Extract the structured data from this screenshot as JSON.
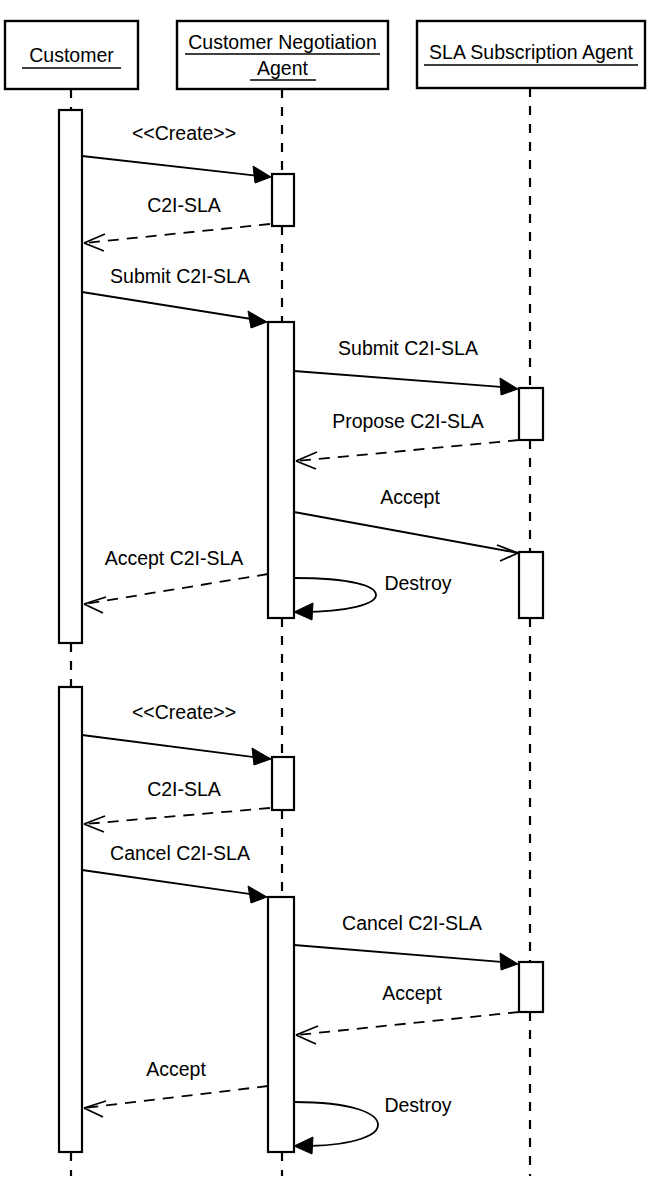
{
  "diagram": {
    "type": "uml-sequence-diagram",
    "title": "",
    "background_color": "#ffffff",
    "line_color": "#000000",
    "width": 656,
    "height": 1182
  },
  "participants": [
    {
      "id": "customer",
      "label": "Customer",
      "label_lines": [
        "Customer"
      ],
      "box": {
        "x": 5,
        "y": 21,
        "w": 133,
        "h": 68
      },
      "lifeline_x": 71
    },
    {
      "id": "customer-negotiation-agent",
      "label": "Customer Negotiation Agent",
      "label_lines": [
        "Customer Negotiation",
        "Agent"
      ],
      "box": {
        "x": 177,
        "y": 21,
        "w": 211,
        "h": 68
      },
      "lifeline_x": 282
    },
    {
      "id": "sla-subscription-agent",
      "label": "SLA Subscription Agent",
      "label_lines": [
        "SLA Subscription Agent"
      ],
      "box": {
        "x": 417,
        "y": 21,
        "w": 228,
        "h": 67
      },
      "lifeline_x": 530
    }
  ],
  "activations": [
    {
      "id": "act-customer-1",
      "participant": "customer",
      "x": 59,
      "y": 110,
      "w": 23,
      "h": 533
    },
    {
      "id": "act-agent-1a",
      "participant": "customer-negotiation-agent",
      "x": 272,
      "y": 174,
      "w": 22,
      "h": 52
    },
    {
      "id": "act-agent-1b",
      "participant": "customer-negotiation-agent",
      "x": 268,
      "y": 322,
      "w": 26,
      "h": 296
    },
    {
      "id": "act-sla-1a",
      "participant": "sla-subscription-agent",
      "x": 519,
      "y": 388,
      "w": 24,
      "h": 52
    },
    {
      "id": "act-sla-1b",
      "participant": "sla-subscription-agent",
      "x": 519,
      "y": 552,
      "w": 24,
      "h": 66
    },
    {
      "id": "act-customer-2",
      "participant": "customer",
      "x": 59,
      "y": 687,
      "w": 23,
      "h": 465
    },
    {
      "id": "act-agent-2a",
      "participant": "customer-negotiation-agent",
      "x": 272,
      "y": 757,
      "w": 22,
      "h": 53
    },
    {
      "id": "act-agent-2b",
      "participant": "customer-negotiation-agent",
      "x": 268,
      "y": 897,
      "w": 26,
      "h": 255
    },
    {
      "id": "act-sla-2a",
      "participant": "sla-subscription-agent",
      "x": 519,
      "y": 962,
      "w": 24,
      "h": 50
    }
  ],
  "messages": [
    {
      "id": "msg-create-1",
      "label": "<<Create>>",
      "from": "customer",
      "to": "customer-negotiation-agent",
      "style": "solid",
      "arrowhead": "filled",
      "direction": "right",
      "x1": 82,
      "y1": 156,
      "x2": 270,
      "y2": 177,
      "label_x": 184,
      "label_y": 140
    },
    {
      "id": "msg-c2i-sla-1",
      "label": "C2I-SLA",
      "from": "customer-negotiation-agent",
      "to": "customer",
      "style": "dashed",
      "arrowhead": "open",
      "direction": "left",
      "x1": 270,
      "y1": 224,
      "x2": 84,
      "y2": 243,
      "label_x": 184,
      "label_y": 212
    },
    {
      "id": "msg-submit-c2i-sla-1",
      "label": "Submit C2I-SLA",
      "from": "customer",
      "to": "customer-negotiation-agent",
      "style": "solid",
      "arrowhead": "filled",
      "direction": "right",
      "x1": 82,
      "y1": 292,
      "x2": 266,
      "y2": 322,
      "label_x": 180,
      "label_y": 283
    },
    {
      "id": "msg-submit-c2i-sla-2",
      "label": "Submit C2I-SLA",
      "from": "customer-negotiation-agent",
      "to": "sla-subscription-agent",
      "style": "solid",
      "arrowhead": "filled",
      "direction": "right",
      "x1": 294,
      "y1": 371,
      "x2": 517,
      "y2": 389,
      "label_x": 408,
      "label_y": 355
    },
    {
      "id": "msg-propose-c2i-sla",
      "label": "Propose C2I-SLA",
      "from": "sla-subscription-agent",
      "to": "customer-negotiation-agent",
      "style": "dashed",
      "arrowhead": "open",
      "direction": "left",
      "x1": 519,
      "y1": 440,
      "x2": 296,
      "y2": 461,
      "label_x": 408,
      "label_y": 428
    },
    {
      "id": "msg-accept-1",
      "label": "Accept",
      "from": "customer-negotiation-agent",
      "to": "sla-subscription-agent",
      "style": "solid",
      "arrowhead": "open",
      "direction": "right",
      "x1": 294,
      "y1": 512,
      "x2": 517,
      "y2": 553,
      "label_x": 410,
      "label_y": 504
    },
    {
      "id": "msg-accept-c2i-sla",
      "label": "Accept C2I-SLA",
      "from": "customer-negotiation-agent",
      "to": "customer",
      "style": "dashed",
      "arrowhead": "open",
      "direction": "left",
      "x1": 268,
      "y1": 574,
      "x2": 84,
      "y2": 604,
      "label_x": 174,
      "label_y": 565
    },
    {
      "id": "msg-destroy-1",
      "label": "Destroy",
      "from": "customer-negotiation-agent",
      "to": "customer-negotiation-agent",
      "style": "self-loop",
      "arrowhead": "filled",
      "direction": "self",
      "loop_start_x": 294,
      "loop_start_y": 578,
      "loop_end_x": 296,
      "loop_end_y": 612,
      "loop_extent_x": 372,
      "label_x": 418,
      "label_y": 590
    },
    {
      "id": "msg-create-2",
      "label": "<<Create>>",
      "from": "customer",
      "to": "customer-negotiation-agent",
      "style": "solid",
      "arrowhead": "filled",
      "direction": "right",
      "x1": 82,
      "y1": 735,
      "x2": 270,
      "y2": 759,
      "label_x": 184,
      "label_y": 719
    },
    {
      "id": "msg-c2i-sla-2",
      "label": "C2I-SLA",
      "from": "customer-negotiation-agent",
      "to": "customer",
      "style": "dashed",
      "arrowhead": "open",
      "direction": "left",
      "x1": 270,
      "y1": 808,
      "x2": 84,
      "y2": 824,
      "label_x": 184,
      "label_y": 796
    },
    {
      "id": "msg-cancel-c2i-sla-1",
      "label": "Cancel C2I-SLA",
      "from": "customer",
      "to": "customer-negotiation-agent",
      "style": "solid",
      "arrowhead": "filled",
      "direction": "right",
      "x1": 82,
      "y1": 870,
      "x2": 266,
      "y2": 897,
      "label_x": 180,
      "label_y": 860
    },
    {
      "id": "msg-cancel-c2i-sla-2",
      "label": "Cancel C2I-SLA",
      "from": "customer-negotiation-agent",
      "to": "sla-subscription-agent",
      "style": "solid",
      "arrowhead": "filled",
      "direction": "right",
      "x1": 294,
      "y1": 945,
      "x2": 517,
      "y2": 964,
      "label_x": 412,
      "label_y": 930
    },
    {
      "id": "msg-accept-2",
      "label": "Accept",
      "from": "sla-subscription-agent",
      "to": "customer-negotiation-agent",
      "style": "dashed",
      "arrowhead": "open",
      "direction": "left",
      "x1": 519,
      "y1": 1012,
      "x2": 296,
      "y2": 1035,
      "label_x": 412,
      "label_y": 1000
    },
    {
      "id": "msg-accept-3",
      "label": "Accept",
      "from": "customer-negotiation-agent",
      "to": "customer",
      "style": "dashed",
      "arrowhead": "open",
      "direction": "left",
      "x1": 268,
      "y1": 1086,
      "x2": 84,
      "y2": 1108,
      "label_x": 176,
      "label_y": 1076
    },
    {
      "id": "msg-destroy-2",
      "label": "Destroy",
      "from": "customer-negotiation-agent",
      "to": "customer-negotiation-agent",
      "style": "self-loop",
      "arrowhead": "filled",
      "direction": "self",
      "loop_start_x": 294,
      "loop_start_y": 1102,
      "loop_end_x": 296,
      "loop_end_y": 1146,
      "loop_extent_x": 372,
      "label_x": 418,
      "label_y": 1112
    }
  ]
}
